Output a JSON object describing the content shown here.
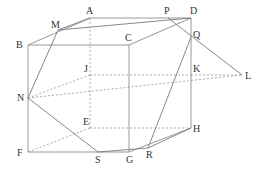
{
  "diagram": {
    "points": {
      "A": {
        "x": 90,
        "y": 18,
        "label": "A",
        "lx": 86,
        "ly": 14
      },
      "D": {
        "x": 191,
        "y": 18,
        "label": "D",
        "lx": 190,
        "ly": 14
      },
      "B": {
        "x": 28,
        "y": 45,
        "label": "B",
        "lx": 16,
        "ly": 48
      },
      "C": {
        "x": 129,
        "y": 45,
        "label": "C",
        "lx": 125,
        "ly": 41
      },
      "J": {
        "x": 90,
        "y": 75,
        "label": "J",
        "lx": 84,
        "ly": 72
      },
      "K": {
        "x": 191,
        "y": 75,
        "label": "K",
        "lx": 193,
        "ly": 72
      },
      "E": {
        "x": 90,
        "y": 128,
        "label": "E",
        "lx": 83,
        "ly": 125
      },
      "H": {
        "x": 191,
        "y": 128,
        "label": "H",
        "lx": 193,
        "ly": 132
      },
      "F": {
        "x": 28,
        "y": 152,
        "label": "F",
        "lx": 17,
        "ly": 156
      },
      "G": {
        "x": 129,
        "y": 152,
        "label": "G",
        "lx": 126,
        "ly": 163
      },
      "M": {
        "x": 58,
        "y": 30,
        "label": "M",
        "lx": 51,
        "ly": 28
      },
      "P": {
        "x": 168,
        "y": 18,
        "label": "P",
        "lx": 164,
        "ly": 14
      },
      "Q": {
        "x": 191,
        "y": 37,
        "label": "Q",
        "lx": 193,
        "ly": 38
      },
      "L": {
        "x": 242,
        "y": 75,
        "label": "L",
        "lx": 245,
        "ly": 79
      },
      "N": {
        "x": 28,
        "y": 98,
        "label": "N",
        "lx": 17,
        "ly": 101
      },
      "S": {
        "x": 98,
        "y": 152,
        "label": "S",
        "lx": 95,
        "ly": 163
      },
      "R": {
        "x": 148,
        "y": 148,
        "label": "R",
        "lx": 146,
        "ly": 158
      }
    },
    "edges_solid": [
      [
        "B",
        "C"
      ],
      [
        "C",
        "D"
      ],
      [
        "D",
        "A"
      ],
      [
        "A",
        "B"
      ],
      [
        "B",
        "F"
      ],
      [
        "F",
        "G"
      ],
      [
        "G",
        "C"
      ],
      [
        "G",
        "H"
      ],
      [
        "H",
        "D"
      ]
    ],
    "edges_hidden": [
      [
        "A",
        "E"
      ],
      [
        "E",
        "F"
      ],
      [
        "E",
        "H"
      ],
      [
        "J",
        "K"
      ],
      [
        "K",
        "L"
      ],
      [
        "N",
        "J"
      ],
      [
        "N",
        "L"
      ]
    ],
    "section_lines": [
      [
        "M",
        "D"
      ],
      [
        "M",
        "N"
      ],
      [
        "M",
        "A"
      ],
      [
        "P",
        "L"
      ],
      [
        "Q",
        "R"
      ],
      [
        "R",
        "S"
      ],
      [
        "S",
        "N"
      ],
      [
        "R",
        "H"
      ]
    ],
    "colors": {
      "line": "#8c8c8c",
      "label": "#333333",
      "background": "#ffffff"
    }
  }
}
